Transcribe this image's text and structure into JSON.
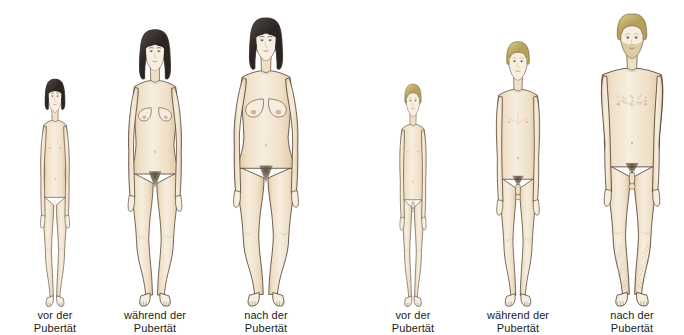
{
  "illustration": {
    "title": "Körperliche Entwicklung in der Pubertät",
    "background_color": "#ffffff",
    "width": 684,
    "height": 335,
    "baseline_y": 301,
    "palette": {
      "skin_light": "#f7eeE0",
      "skin_mid": "#efdfc6",
      "skin_shadow": "#dcc3a0",
      "skin_deep": "#c9a87e",
      "outline": "#4a3c2e",
      "hair_dark": "#2a2523",
      "hair_dark_hi": "#4d4542",
      "hair_blond": "#b5a15a",
      "hair_blond_hi": "#d8c88a",
      "pubic_hair": "#5a4a35",
      "caption_text": "#1c1c1c",
      "nipple": "#d9a78c"
    },
    "groups": [
      {
        "id": "female",
        "label": "weiblich",
        "figures": [
          {
            "id": "female-pre",
            "stage": "pre",
            "sex": "female",
            "caption_line1": "vor der",
            "caption_line2": "Pubertät",
            "center_x": 55,
            "body_height": 232,
            "head_top_y": 69,
            "hair": "dark",
            "hair_style": "bob-short",
            "has_breasts": false,
            "has_pubic_hair": false,
            "has_body_hair": false,
            "has_beard": false,
            "shoulder_width": 38,
            "hip_width": 40,
            "scale": 0.595
          },
          {
            "id": "female-during",
            "stage": "during",
            "sex": "female",
            "caption_line1": "während der",
            "caption_line2": "Pubertät",
            "center_x": 155,
            "body_height": 281,
            "head_top_y": 20,
            "hair": "dark",
            "hair_style": "bob-long",
            "has_breasts": true,
            "breast_size": "small",
            "has_pubic_hair": true,
            "has_body_hair": false,
            "has_beard": false,
            "shoulder_width": 48,
            "hip_width": 54,
            "scale": 0.855
          },
          {
            "id": "female-post",
            "stage": "post",
            "sex": "female",
            "caption_line1": "nach der",
            "caption_line2": "Pubertät",
            "center_x": 266,
            "body_height": 293,
            "head_top_y": 8,
            "hair": "dark",
            "hair_style": "bob-long",
            "has_breasts": true,
            "breast_size": "full",
            "has_pubic_hair": true,
            "has_body_hair": false,
            "has_beard": false,
            "shoulder_width": 52,
            "hip_width": 62,
            "scale": 0.92
          }
        ]
      },
      {
        "id": "male",
        "label": "männlich",
        "figures": [
          {
            "id": "male-pre",
            "stage": "pre",
            "sex": "male",
            "caption_line1": "vor der",
            "caption_line2": "Pubertät",
            "center_x": 413,
            "body_height": 227,
            "head_top_y": 74,
            "hair": "blond",
            "hair_style": "short",
            "has_breasts": false,
            "has_pubic_hair": false,
            "has_body_hair": false,
            "has_beard": false,
            "shoulder_width": 38,
            "hip_width": 36,
            "scale": 0.585
          },
          {
            "id": "male-during",
            "stage": "during",
            "sex": "male",
            "caption_line1": "während der",
            "caption_line2": "Pubertät",
            "center_x": 518,
            "body_height": 270,
            "head_top_y": 31,
            "hair": "blond",
            "hair_style": "short",
            "has_breasts": false,
            "has_pubic_hair": true,
            "has_body_hair": false,
            "has_beard": false,
            "shoulder_width": 48,
            "hip_width": 44,
            "scale": 0.81
          },
          {
            "id": "male-post",
            "stage": "post",
            "sex": "male",
            "caption_line1": "nach der",
            "caption_line2": "Pubertät",
            "center_x": 632,
            "body_height": 296,
            "head_top_y": 5,
            "hair": "blond",
            "hair_style": "curly",
            "has_breasts": false,
            "has_pubic_hair": true,
            "has_body_hair": true,
            "has_beard": true,
            "shoulder_width": 62,
            "hip_width": 50,
            "scale": 0.95
          }
        ]
      }
    ]
  }
}
